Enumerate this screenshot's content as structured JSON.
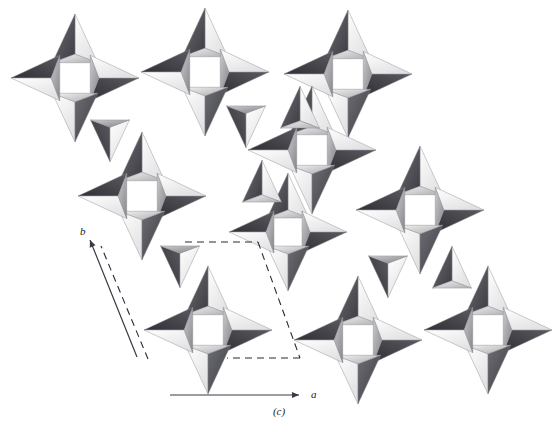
{
  "figure": {
    "kind": "crystal-structure-polyhedral-diagram",
    "caption": "(c)",
    "background_color": "#ffffff",
    "width": 558,
    "height": 442
  },
  "axes": {
    "a": {
      "label": "a",
      "direction": "horizontal-right",
      "x1": 170,
      "y1": 395,
      "x2": 299,
      "y2": 395,
      "label_x": 311,
      "label_y": 398
    },
    "b": {
      "label": "b",
      "direction": "up-right",
      "x1": 137,
      "y1": 357,
      "x2": 90,
      "y2": 240,
      "label_x": 80,
      "label_y": 235
    },
    "axis_color": "#3a3a46"
  },
  "unit_cell": {
    "style": "dashed",
    "color": "#2a2a33",
    "dash": "7,5",
    "corners": [
      {
        "x": 185,
        "y": 242
      },
      {
        "x": 258,
        "y": 242
      },
      {
        "x": 300,
        "y": 358
      },
      {
        "x": 227,
        "y": 358
      }
    ],
    "edges_drawn": [
      "top",
      "right",
      "bottom"
    ],
    "guide_line": {
      "x1": 148,
      "y1": 359,
      "x2": 101,
      "y2": 246
    }
  },
  "palette": {
    "face_light": "#ffffff",
    "face_mid": "#d8d8da",
    "face_shade": "#9a9a9e",
    "face_dark": "#4a4a50",
    "edge": "#8c8c92"
  },
  "chart_data": {
    "type": "diagram",
    "title": "",
    "motif": "four-membered ring of corner-sharing tetrahedra enclosing a square void",
    "projection": "down c, a to the right, b up and to the left",
    "ring_clusters": [
      {
        "id": "r1",
        "cx": 75,
        "cy": 78,
        "scale": 1.0,
        "rot": 0
      },
      {
        "id": "r2",
        "cx": 205,
        "cy": 72,
        "scale": 1.0,
        "rot": 0
      },
      {
        "id": "r3",
        "cx": 348,
        "cy": 74,
        "scale": 1.0,
        "rot": 0
      },
      {
        "id": "r4",
        "cx": 142,
        "cy": 196,
        "scale": 1.0,
        "rot": 0
      },
      {
        "id": "r5",
        "cx": 312,
        "cy": 150,
        "scale": 1.0,
        "rot": 0
      },
      {
        "id": "r6",
        "cx": 288,
        "cy": 232,
        "scale": 0.92,
        "rot": 0
      },
      {
        "id": "r7",
        "cx": 420,
        "cy": 210,
        "scale": 1.0,
        "rot": 0
      },
      {
        "id": "r8",
        "cx": 208,
        "cy": 330,
        "scale": 1.0,
        "rot": 0
      },
      {
        "id": "r9",
        "cx": 358,
        "cy": 340,
        "scale": 1.0,
        "rot": 0
      },
      {
        "id": "r10",
        "cx": 488,
        "cy": 330,
        "scale": 1.0,
        "rot": 0
      }
    ],
    "connector_tetrahedra": [
      {
        "cx": 110,
        "cy": 136,
        "scale": 0.86,
        "flip": true
      },
      {
        "cx": 246,
        "cy": 122,
        "scale": 0.86,
        "flip": true
      },
      {
        "cx": 300,
        "cy": 112,
        "scale": 0.86,
        "flip": false
      },
      {
        "cx": 180,
        "cy": 262,
        "scale": 0.86,
        "flip": true
      },
      {
        "cx": 262,
        "cy": 186,
        "scale": 0.86,
        "flip": false
      },
      {
        "cx": 388,
        "cy": 272,
        "scale": 0.86,
        "flip": true
      },
      {
        "cx": 452,
        "cy": 272,
        "scale": 0.86,
        "flip": false
      }
    ],
    "xlabel": "a",
    "ylabel": "b",
    "grid": false,
    "legend": "none"
  }
}
